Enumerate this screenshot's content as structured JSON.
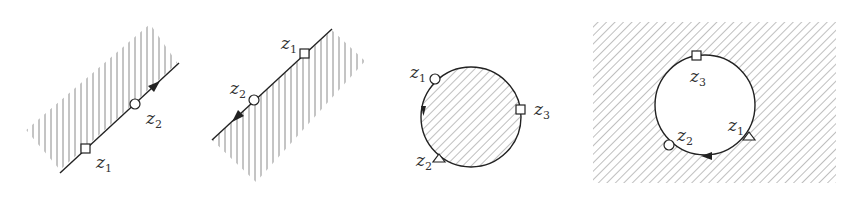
{
  "figure": {
    "colors": {
      "stroke": "#222222",
      "hatch": "#8a8a8a",
      "label": "#333333"
    },
    "panels": [
      {
        "id": "panel-1",
        "kind": "line",
        "shaded_side": "upper-left",
        "hatch": "vertical",
        "direction": "toward z2 (up-right)",
        "points": [
          {
            "name": "z",
            "sub": "1",
            "marker": "square"
          },
          {
            "name": "z",
            "sub": "2",
            "marker": "circle"
          }
        ]
      },
      {
        "id": "panel-2",
        "kind": "line",
        "shaded_side": "lower-right",
        "hatch": "vertical",
        "direction": "toward z2 (down-left)",
        "points": [
          {
            "name": "z",
            "sub": "1",
            "marker": "square"
          },
          {
            "name": "z",
            "sub": "2",
            "marker": "circle"
          }
        ]
      },
      {
        "id": "panel-3",
        "kind": "circle",
        "shaded_side": "interior",
        "hatch": "diagonal",
        "direction": "counter-clockwise",
        "points": [
          {
            "name": "z",
            "sub": "1",
            "marker": "circle"
          },
          {
            "name": "z",
            "sub": "2",
            "marker": "triangle"
          },
          {
            "name": "z",
            "sub": "3",
            "marker": "square"
          }
        ]
      },
      {
        "id": "panel-4",
        "kind": "circle",
        "shaded_side": "exterior",
        "hatch": "diagonal",
        "direction": "clockwise",
        "points": [
          {
            "name": "z",
            "sub": "1",
            "marker": "triangle"
          },
          {
            "name": "z",
            "sub": "2",
            "marker": "circle"
          },
          {
            "name": "z",
            "sub": "3",
            "marker": "square"
          }
        ]
      }
    ]
  }
}
